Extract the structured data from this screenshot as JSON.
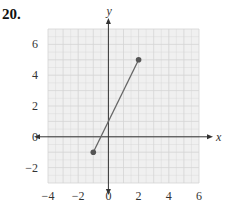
{
  "problem_number": "20.",
  "colors": {
    "grid_bg": "#f0f0f0",
    "grid_line": "#d4d4d4",
    "axis": "#333333",
    "segment": "#666666",
    "point": "#555555"
  },
  "chart_data": {
    "type": "line",
    "title": "",
    "xlabel": "x",
    "ylabel": "y",
    "xlim": [
      -4,
      6
    ],
    "ylim": [
      -3,
      7
    ],
    "x_ticks": [
      "−4",
      "−2",
      "0",
      "2",
      "4",
      "6"
    ],
    "y_ticks": [
      "6",
      "4",
      "2",
      "0",
      "−2"
    ],
    "grid": true,
    "series": [
      {
        "name": "segment",
        "points": [
          {
            "x": -1,
            "y": -1
          },
          {
            "x": 2,
            "y": 5
          }
        ],
        "endpoints_marked": true
      }
    ]
  }
}
